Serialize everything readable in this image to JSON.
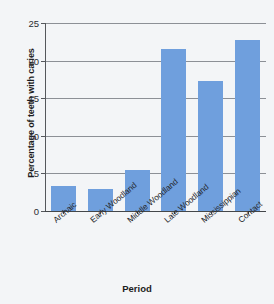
{
  "chart_data": {
    "type": "bar",
    "title": "",
    "xlabel": "Period",
    "ylabel": "Percentage of teeth with caries",
    "categories": [
      "Archaic",
      "Early Woodland",
      "Middle Woodland",
      "Late Woodland",
      "Mississippian",
      "Contact"
    ],
    "values": [
      3.3,
      2.9,
      5.5,
      21.5,
      17.3,
      22.7
    ],
    "ylim": [
      0,
      25
    ],
    "yticks": [
      0,
      5,
      10,
      15,
      20,
      25
    ],
    "ytick_labels": [
      "0",
      "5",
      "10",
      "15",
      "20",
      "25"
    ],
    "grid": "horizontal",
    "legend": "none",
    "bar_color": "#6f9fdd",
    "background_color": "#f3f5f7",
    "axis_color": "#44474a",
    "gridline_color": "#8c9096"
  }
}
